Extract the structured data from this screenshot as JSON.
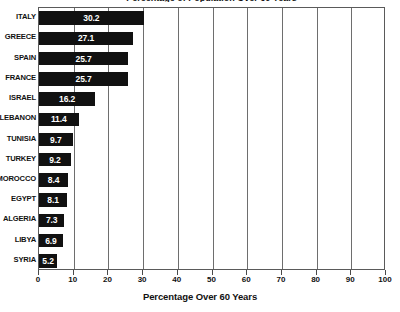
{
  "chart_data": {
    "type": "bar",
    "orientation": "horizontal",
    "title": "",
    "cropped_title_fragment": "Percentage of Population Over 60 Years",
    "xlabel": "Percentage Over 60 Years",
    "ylabel": "",
    "xlim": [
      0,
      100
    ],
    "xticks": [
      0,
      10,
      20,
      30,
      40,
      50,
      60,
      70,
      80,
      90,
      100
    ],
    "xtick_labels": [
      "0",
      "10",
      "20",
      "30",
      "40",
      "50",
      "60",
      "70",
      "80",
      "90",
      "100"
    ],
    "grid": true,
    "grid_axis": "x",
    "legend": false,
    "bar_color": "#111111",
    "value_label_color": "#ffffff",
    "categories": [
      "ITALY",
      "GREECE",
      "SPAIN",
      "FRANCE",
      "ISRAEL",
      "LEBANON",
      "TUNISIA",
      "TURKEY",
      "MOROCCO",
      "EGYPT",
      "ALGERIA",
      "LIBYA",
      "SYRIA"
    ],
    "values": [
      30.2,
      27.1,
      25.7,
      25.7,
      16.2,
      11.4,
      9.7,
      9.2,
      8.4,
      8.1,
      7.3,
      6.9,
      5.2
    ],
    "value_labels": [
      "30.2",
      "27.1",
      "25.7",
      "25.7",
      "16.2",
      "11.4",
      "9.7",
      "9.2",
      "8.4",
      "8.1",
      "7.3",
      "6.9",
      "5.2"
    ]
  },
  "axis": {
    "x_title": "Percentage Over 60 Years"
  }
}
